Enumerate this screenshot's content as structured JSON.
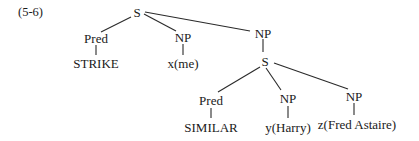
{
  "example_number": "(5-6)",
  "tree": {
    "root": {
      "label": "S"
    },
    "pred1": {
      "label": "Pred",
      "leaf": "STRIKE"
    },
    "np1": {
      "label": "NP",
      "leaf": "x(me)"
    },
    "np2": {
      "label": "NP"
    },
    "s2": {
      "label": "S"
    },
    "pred2": {
      "label": "Pred",
      "leaf": "SIMILAR"
    },
    "np3": {
      "label": "NP",
      "leaf": "y(Harry)"
    },
    "np4": {
      "label": "NP",
      "leaf": "z(Fred Astaire)"
    }
  }
}
